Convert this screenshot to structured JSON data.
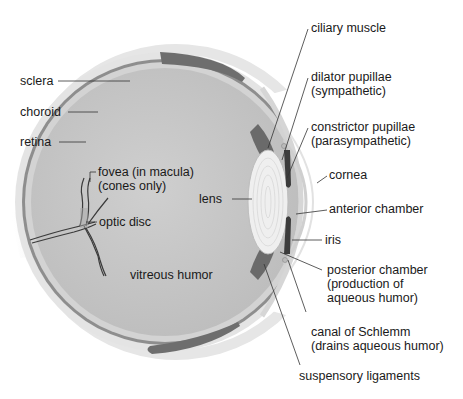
{
  "diagram": {
    "colors": {
      "background": "#ffffff",
      "sclera": "#e4e4e4",
      "choroid": "#8a8a8a",
      "retina": "#d2d2d2",
      "vitreous": "#c4c4c4",
      "eyelid": "#6e6e6e",
      "muscle": "#555555",
      "lens": "#efefef",
      "text": "#1a1a1a",
      "leader": "#333333"
    },
    "labels": {
      "sclera": "sclera",
      "choroid": "choroid",
      "retina": "retina",
      "fovea_line1": "fovea (in macula)",
      "fovea_line2": "(cones only)",
      "optic_disc": "optic disc",
      "lens": "lens",
      "vitreous_humor": "vitreous humor",
      "ciliary_muscle": "ciliary muscle",
      "dilator_line1": "dilator pupillae",
      "dilator_line2": "(sympathetic)",
      "constrictor_line1": "constrictor pupillae",
      "constrictor_line2": "(parasympathetic)",
      "cornea": "cornea",
      "anterior_chamber": "anterior chamber",
      "iris": "iris",
      "posterior_line1": "posterior chamber",
      "posterior_line2": "(production of",
      "posterior_line3": "aqueous humor)",
      "schlemm_line1": "canal of Schlemm",
      "schlemm_line2": "(drains aqueous humor)",
      "suspensory_ligaments": "suspensory ligaments"
    }
  }
}
